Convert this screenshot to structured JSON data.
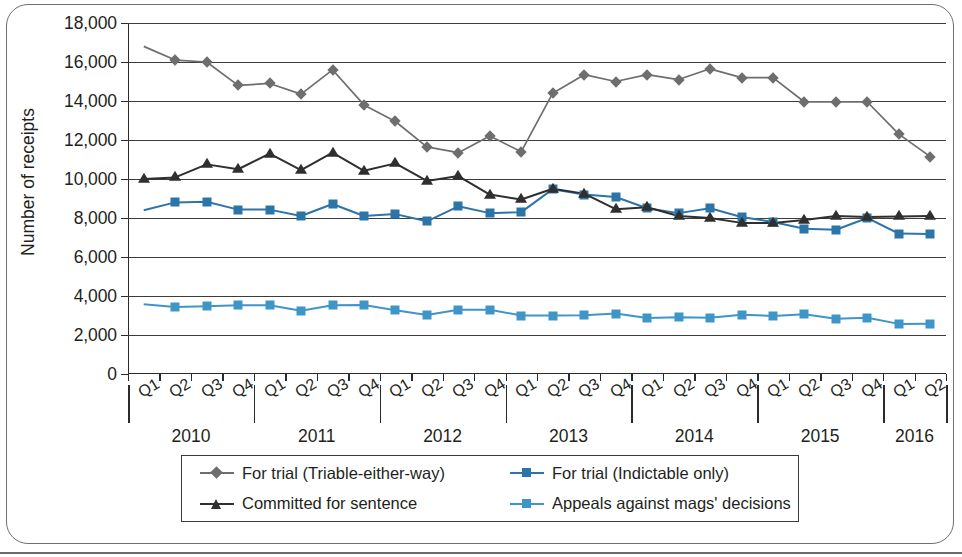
{
  "chart_data": {
    "type": "line",
    "title": "",
    "subtitle": "",
    "xlabel": "",
    "ylabel": "Number of receipts",
    "ylim": [
      0,
      18000
    ],
    "ytick_step": 2000,
    "ytick_labels": [
      "18,000",
      "16,000",
      "14,000",
      "12,000",
      "10,000",
      "8,000",
      "6,000",
      "4,000",
      "2,000",
      "0"
    ],
    "ytick_values": [
      18000,
      16000,
      14000,
      12000,
      10000,
      8000,
      6000,
      4000,
      2000,
      0
    ],
    "grid": true,
    "grid_axis": "y",
    "legend_position": "bottom",
    "x": [
      "2010 Q1",
      "2010 Q2",
      "2010 Q3",
      "2010 Q4",
      "2011 Q1",
      "2011 Q2",
      "2011 Q3",
      "2011 Q4",
      "2012 Q1",
      "2012 Q2",
      "2012 Q3",
      "2012 Q4",
      "2013 Q1",
      "2013 Q2",
      "2013 Q3",
      "2013 Q4",
      "2014 Q1",
      "2014 Q2",
      "2014 Q3",
      "2014 Q4",
      "2015 Q1",
      "2015 Q2",
      "2015 Q3",
      "2015 Q4",
      "2016 Q1",
      "2016 Q2"
    ],
    "quarter_labels": [
      "Q1",
      "Q2",
      "Q3",
      "Q4",
      "Q1",
      "Q2",
      "Q3",
      "Q4",
      "Q1",
      "Q2",
      "Q3",
      "Q4",
      "Q1",
      "Q2",
      "Q3",
      "Q4",
      "Q1",
      "Q2",
      "Q3",
      "Q4",
      "Q1",
      "Q2",
      "Q3",
      "Q4",
      "Q1",
      "Q2"
    ],
    "year_groups": [
      {
        "year": "2010",
        "quarters": 4
      },
      {
        "year": "2011",
        "quarters": 4
      },
      {
        "year": "2012",
        "quarters": 4
      },
      {
        "year": "2013",
        "quarters": 4
      },
      {
        "year": "2014",
        "quarters": 4
      },
      {
        "year": "2015",
        "quarters": 4
      },
      {
        "year": "2016",
        "quarters": 2
      }
    ],
    "series": [
      {
        "name": "For trial (Triable-either-way)",
        "color": "#6e6e6e",
        "marker": "diamond",
        "values": [
          16800,
          16100,
          16000,
          14800,
          14900,
          14350,
          15600,
          13800,
          12950,
          11650,
          11350,
          12200,
          11400,
          14400,
          15350,
          15000,
          15350,
          15100,
          15650,
          15200,
          15200,
          13950,
          13950,
          13950,
          12300,
          11150
        ]
      },
      {
        "name": "For trial (Indictable only)",
        "color": "#2c75a8",
        "marker": "square",
        "values": [
          8400,
          8800,
          8830,
          8430,
          8430,
          8100,
          8720,
          8100,
          8200,
          7830,
          8600,
          8250,
          8300,
          9480,
          9200,
          9080,
          8500,
          8250,
          8500,
          8050,
          7800,
          7450,
          7400,
          8000,
          7200,
          7180
        ]
      },
      {
        "name": "Committed for sentence",
        "color": "#2f2f2f",
        "marker": "triangle",
        "values": [
          10000,
          10080,
          10750,
          10500,
          11300,
          10450,
          11350,
          10420,
          10800,
          9900,
          10150,
          9200,
          8950,
          9500,
          9250,
          8450,
          8550,
          8100,
          8000,
          7750,
          7750,
          7900,
          8100,
          8050,
          8080,
          8100
        ]
      },
      {
        "name": "Appeals against mags' decisions",
        "color": "#3e96c8",
        "marker": "square",
        "values": [
          3580,
          3430,
          3470,
          3520,
          3530,
          3240,
          3520,
          3540,
          3270,
          3030,
          3290,
          3300,
          3000,
          3000,
          3010,
          3100,
          2870,
          2910,
          2890,
          3040,
          2980,
          3060,
          2830,
          2880,
          2570,
          2580
        ]
      }
    ]
  },
  "legend": {
    "items": [
      {
        "label": "For trial (Triable-either-way)",
        "color": "#6e6e6e",
        "marker": "diamond"
      },
      {
        "label": "For trial (Indictable only)",
        "color": "#2c75a8",
        "marker": "square"
      },
      {
        "label": "Committed for sentence",
        "color": "#2f2f2f",
        "marker": "triangle"
      },
      {
        "label": "Appeals against mags' decisions",
        "color": "#3e96c8",
        "marker": "square"
      }
    ]
  }
}
